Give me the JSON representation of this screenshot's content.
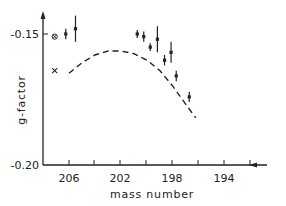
{
  "chart_data": {
    "type": "scatter",
    "title": "",
    "xlabel": "mass number",
    "ylabel": "g-factor",
    "x_reversed": true,
    "xlim": [
      208.5,
      189.5
    ],
    "ylim": [
      -0.2,
      -0.14
    ],
    "x_ticks": [
      206,
      204,
      202,
      200,
      198,
      196,
      194,
      192
    ],
    "x_tick_labels": [
      "206",
      "202",
      "198",
      "194"
    ],
    "y_tick_labels": [
      "-0.15",
      "-0.20"
    ],
    "grid": false,
    "legend": null,
    "series": [
      {
        "name": "measured",
        "marker": "dot-with-errorbar",
        "points": [
          {
            "x": 206.5,
            "y": -0.15,
            "err": 0.002
          },
          {
            "x": 205.0,
            "y": -0.148,
            "err": 0.005
          },
          {
            "x": 195.5,
            "y": -0.15,
            "err": 0.0015
          },
          {
            "x": 194.5,
            "y": -0.151,
            "err": 0.002
          },
          {
            "x": 193.5,
            "y": -0.155,
            "err": 0.0015
          },
          {
            "x": 192.4,
            "y": -0.152,
            "err": 0.005
          },
          {
            "x": 191.3,
            "y": -0.16,
            "err": 0.002
          },
          {
            "x": 190.3,
            "y": -0.157,
            "err": 0.004
          },
          {
            "x": 189.5,
            "y": -0.166,
            "err": 0.002
          },
          {
            "x": 187.5,
            "y": -0.174,
            "err": 0.002
          }
        ]
      },
      {
        "name": "circled-cross",
        "marker": "circle-cross",
        "points": [
          {
            "x": 208.2,
            "y": -0.151
          }
        ]
      },
      {
        "name": "cross",
        "marker": "x",
        "points": [
          {
            "x": 208.2,
            "y": -0.164
          }
        ]
      },
      {
        "name": "theory",
        "style": "dashed",
        "points": [
          {
            "x": 206.0,
            "y": -0.165
          },
          {
            "x": 204.0,
            "y": -0.161
          },
          {
            "x": 202.0,
            "y": -0.158
          },
          {
            "x": 200.0,
            "y": -0.1565
          },
          {
            "x": 198.0,
            "y": -0.1565
          },
          {
            "x": 196.0,
            "y": -0.1575
          },
          {
            "x": 194.0,
            "y": -0.16
          },
          {
            "x": 192.0,
            "y": -0.164
          },
          {
            "x": 190.0,
            "y": -0.17
          },
          {
            "x": 188.0,
            "y": -0.177
          },
          {
            "x": 186.5,
            "y": -0.182
          }
        ]
      }
    ]
  },
  "axes": {
    "xlabel": "mass number",
    "ylabel": "g-factor",
    "x_tick_labels": [
      "206",
      "202",
      "198",
      "194"
    ],
    "y_tick_labels": [
      "-0.15",
      "-0.20"
    ]
  }
}
